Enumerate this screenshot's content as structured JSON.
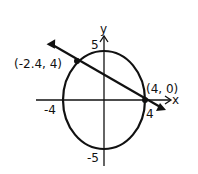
{
  "diagram": {
    "type": "ellipse-line-intersection",
    "axes": {
      "x_label": "x",
      "y_label": "y"
    },
    "ellipse": {
      "x_intercepts": [
        "-4",
        "4"
      ],
      "y_intercepts": [
        "5",
        "-5"
      ]
    },
    "line": {
      "points": [
        "(-2.4, 4)",
        "(4, 0)"
      ]
    },
    "labels": {
      "y_axis": "y",
      "x_axis": "x",
      "top": "5",
      "bottom": "-5",
      "left": "-4",
      "right": "4",
      "point1": "(-2.4, 4)",
      "point2": "(4, 0)"
    },
    "colors": {
      "stroke": "#111111",
      "background": "#ffffff"
    }
  }
}
